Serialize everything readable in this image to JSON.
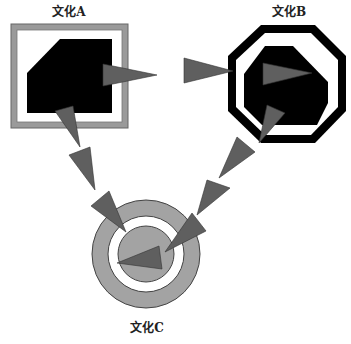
{
  "diagram": {
    "title": "",
    "nodes": [
      {
        "id": "A",
        "label": "文化A",
        "shape": "square-frame-with-cut-corner-block"
      },
      {
        "id": "B",
        "label": "文化B",
        "shape": "octagon-frame-with-octagon-block"
      },
      {
        "id": "C",
        "label": "文化C",
        "shape": "concentric-circles"
      }
    ],
    "edges": [
      {
        "from": "A",
        "to": "B",
        "style": "triangle-arrow-segments"
      },
      {
        "from": "A",
        "to": "C",
        "style": "triangle-arrow-segments"
      },
      {
        "from": "B",
        "to": "C",
        "style": "triangle-arrow-segments"
      }
    ]
  },
  "labels": {
    "a": "文化A",
    "b": "文化B",
    "c": "文化C"
  },
  "colors": {
    "frame_gray": "#9a9a9a",
    "frame_stroke": "#555555",
    "block_black": "#000000",
    "arrow_gray": "#5f5f5f",
    "circle_gray": "#a3a3a3",
    "background": "#ffffff"
  }
}
